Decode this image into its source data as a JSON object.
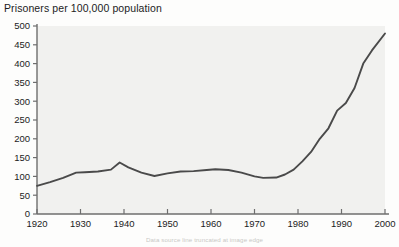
{
  "chart_data": {
    "type": "line",
    "title": "Prisoners per 100,000 population",
    "xlabel": "",
    "ylabel": "",
    "xlim": [
      1920,
      2000
    ],
    "ylim": [
      0,
      500
    ],
    "ytick_step": 50,
    "xtick_step": 10,
    "grid": false,
    "legend": false,
    "line_color": "#4a4a4a",
    "plot_background": "#f1f1ef",
    "yticks": [
      0,
      50,
      100,
      150,
      200,
      250,
      300,
      350,
      400,
      450,
      500
    ],
    "xticks": [
      1920,
      1930,
      1940,
      1950,
      1960,
      1970,
      1980,
      1990,
      2000
    ],
    "series": [
      {
        "name": "Prisoners per 100,000 population",
        "x": [
          1920,
          1923,
          1926,
          1929,
          1931,
          1934,
          1937,
          1939,
          1941,
          1944,
          1947,
          1950,
          1953,
          1956,
          1959,
          1961,
          1964,
          1967,
          1970,
          1972,
          1975,
          1977,
          1979,
          1981,
          1983,
          1985,
          1987,
          1989,
          1991,
          1993,
          1995,
          1997,
          2000
        ],
        "values": [
          75,
          85,
          96,
          110,
          111,
          113,
          118,
          137,
          124,
          110,
          101,
          108,
          113,
          114,
          117,
          119,
          117,
          110,
          100,
          96,
          97,
          105,
          118,
          140,
          165,
          200,
          228,
          275,
          295,
          335,
          400,
          435,
          480
        ]
      }
    ]
  },
  "caption": {
    "text": "Data source line truncated at image edge"
  }
}
